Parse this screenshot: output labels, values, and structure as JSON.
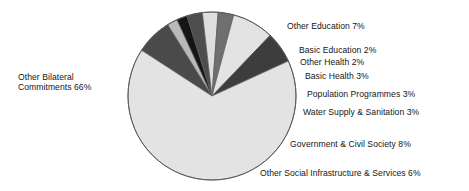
{
  "chart_data": {
    "type": "pie",
    "title": "",
    "subtitle": "",
    "xlabel": "",
    "ylabel": "",
    "legend_position": "none",
    "grid": false,
    "unit": "%",
    "labels_outside": true,
    "categories": [
      "Other Bilateral Commitments",
      "Other Education",
      "Basic Education",
      "Other Health",
      "Basic Health",
      "Population Programmes",
      "Water Supply & Sanitation",
      "Government & Civil Society",
      "Other Social Infrastructure & Services"
    ],
    "values": [
      66,
      7,
      2,
      2,
      3,
      3,
      3,
      8,
      6
    ],
    "slices": [
      {
        "name": "other-education",
        "label": "Other Education 7%",
        "category": "Other Education",
        "value": 7,
        "color": "#4a4a4a"
      },
      {
        "name": "basic-education",
        "label": "Basic Education 2%",
        "category": "Basic Education",
        "value": 2,
        "color": "#b9b9b9"
      },
      {
        "name": "other-health",
        "label": "Other Health 2%",
        "category": "Other Health",
        "value": 2,
        "color": "#151515"
      },
      {
        "name": "basic-health",
        "label": "Basic Health 3%",
        "category": "Basic Health",
        "value": 3,
        "color": "#4d4d4d"
      },
      {
        "name": "population-programmes",
        "label": "Population Programmes 3%",
        "category": "Population Programmes",
        "value": 3,
        "color": "#dedede"
      },
      {
        "name": "water-supply-sanitation",
        "label": "Water Supply & Sanitation 3%",
        "category": "Water Supply & Sanitation",
        "value": 3,
        "color": "#6f6f6f"
      },
      {
        "name": "government-civil-society",
        "label": "Government & Civil Society 8%",
        "category": "Government & Civil Society",
        "value": 8,
        "color": "#e3e3e3"
      },
      {
        "name": "other-social-infrastructure-services",
        "label": "Other Social Infrastructure & Services 6%",
        "category": "Other Social Infrastructure & Services",
        "value": 6,
        "color": "#3d3d3d"
      },
      {
        "name": "other-bilateral-commitments",
        "label": "Other Bilateral\nCommitments 66%",
        "category": "Other Bilateral Commitments",
        "value": 66,
        "color": "#e3e3e3"
      }
    ],
    "colors": {
      "background": "#ffffff",
      "outline": "#5a5a5a",
      "text": "#161616"
    }
  }
}
